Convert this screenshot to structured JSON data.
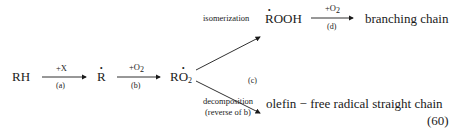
{
  "species": {
    "rh": "RH",
    "r_radical": "R",
    "ro2_radical_base": "RO",
    "ro2_sub": "2",
    "rooh_radical": "ROOH"
  },
  "steps": {
    "a": {
      "reagent": "+X",
      "label": "(a)"
    },
    "b": {
      "reagent_base": "+O",
      "reagent_sub": "2",
      "label": "(b)"
    },
    "c": {
      "label": "(c)"
    },
    "d": {
      "reagent_base": "+O",
      "reagent_sub": "2",
      "label": "(d)"
    }
  },
  "branches": {
    "upper": {
      "process": "isomerization",
      "product": "branching chain"
    },
    "lower": {
      "process": "decomposition",
      "note": "(reverse of b)",
      "product": "olefin − free radical straight chain"
    }
  },
  "equation_number": "(60)"
}
